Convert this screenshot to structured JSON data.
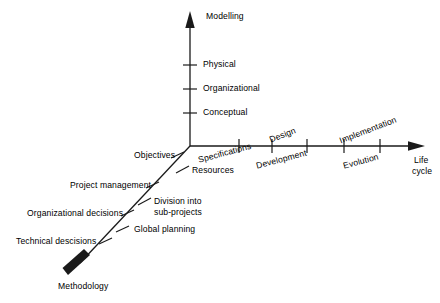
{
  "figure": {
    "type": "three-axis-conceptual-diagram",
    "background_color": "#ffffff",
    "line_color": "#1a1a1a",
    "text_color": "#000000"
  },
  "axes": {
    "vertical": {
      "name": "Modelling",
      "title": "Modelling",
      "direction": "up",
      "ticks": [
        {
          "label": "Physical"
        },
        {
          "label": "Organizational"
        },
        {
          "label": "Conceptual"
        }
      ]
    },
    "horizontal": {
      "name": "Life cycle",
      "title_line1": "Life",
      "title_line2": "cycle",
      "direction": "right",
      "labels_above": [
        {
          "label": "Design"
        },
        {
          "label": "Implementation"
        }
      ],
      "labels_below": [
        {
          "label": "Specifications"
        },
        {
          "label": "Development"
        },
        {
          "label": "Evolution"
        }
      ]
    },
    "diagonal": {
      "name": "Methodology",
      "title": "Methodology",
      "direction": "down-left",
      "ticks": [
        {
          "label": "Objectives"
        },
        {
          "label": "Resources"
        },
        {
          "label": "Project management"
        },
        {
          "label_line1": "Division into",
          "label_line2": "sub-projects"
        },
        {
          "label": "Organizational decisions"
        },
        {
          "label": "Global planning"
        },
        {
          "label": "Technical descisions"
        }
      ]
    }
  }
}
